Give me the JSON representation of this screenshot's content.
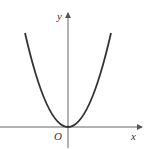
{
  "diagram": {
    "labels": {
      "x_axis": "x",
      "y_axis": "y",
      "origin": "O"
    },
    "colors": {
      "axis": "#666666",
      "curve": "#333333",
      "label": "#333333"
    },
    "curve": {
      "type": "parabola",
      "opens": "up",
      "vertex": [
        0,
        0
      ]
    }
  }
}
